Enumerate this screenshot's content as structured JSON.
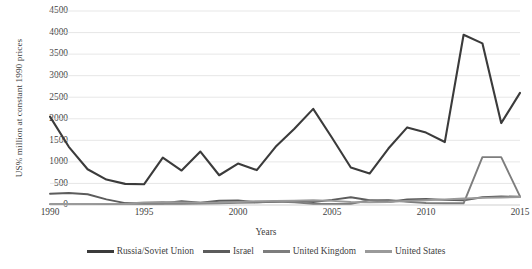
{
  "chart_data": {
    "type": "line",
    "title": "",
    "xlabel": "Years",
    "ylabel": "US% million at constant 1990 prices",
    "ylim": [
      0,
      4500
    ],
    "xlim": [
      1990,
      2015
    ],
    "ytick_step": 500,
    "grid": true,
    "legend_position": "bottom",
    "yticks": [
      "4500",
      "4000",
      "3500",
      "3000",
      "2500",
      "2000",
      "1500",
      "1000",
      "500",
      "0"
    ],
    "xticks": [
      "1990",
      "1995",
      "2000",
      "2005",
      "2010",
      "2015"
    ],
    "x": [
      1990,
      1991,
      1992,
      1993,
      1994,
      1995,
      1996,
      1997,
      1998,
      1999,
      2000,
      2001,
      2002,
      2003,
      2004,
      2005,
      2006,
      2007,
      2008,
      2009,
      2010,
      2011,
      2012,
      2013,
      2014,
      2015
    ],
    "series": [
      {
        "name": "Russia/Soviet Union",
        "color": "#3b3b3b",
        "values": [
          2050,
          1350,
          830,
          590,
          490,
          480,
          1100,
          800,
          1240,
          690,
          960,
          810,
          1350,
          1770,
          2230,
          1560,
          870,
          730,
          1310,
          1800,
          1680,
          1460,
          1490,
          1870,
          2430,
          2600
        ]
      },
      {
        "name": "Israel",
        "color": "#5c5c5c",
        "values": [
          260,
          280,
          250,
          130,
          45,
          40,
          40,
          90,
          55,
          100,
          105,
          60,
          75,
          90,
          70,
          120,
          180,
          110,
          70,
          130,
          140,
          120,
          110,
          180,
          200,
          190
        ]
      },
      {
        "name": "United Kingdom",
        "color": "#7d7d7d",
        "values": [
          20,
          25,
          25,
          20,
          25,
          30,
          35,
          30,
          35,
          40,
          50,
          60,
          80,
          60,
          30,
          25,
          30,
          110,
          115,
          75,
          45,
          40,
          40,
          50,
          1110,
          200
        ]
      },
      {
        "name": "United States",
        "color": "#9a9a9a",
        "values": [
          20,
          22,
          25,
          25,
          30,
          60,
          70,
          60,
          55,
          55,
          70,
          90,
          95,
          100,
          110,
          95,
          70,
          60,
          70,
          95,
          110,
          130,
          150,
          165,
          175,
          185
        ]
      }
    ],
    "notable_points": [
      {
        "series": "Russia/Soviet Union",
        "year": 2012,
        "value": 3950,
        "note": "peak"
      },
      {
        "series": "Russia/Soviet Union",
        "year": 2013,
        "value": 3750
      },
      {
        "series": "Russia/Soviet Union",
        "year": 2014,
        "value": 1900
      },
      {
        "series": "United Kingdom",
        "year": 2013,
        "value": 1110,
        "note": "spike"
      }
    ]
  }
}
